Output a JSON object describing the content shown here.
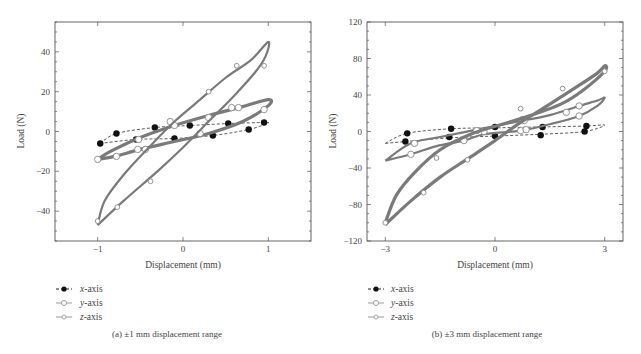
{
  "figure": {
    "panels": [
      {
        "id": "a",
        "caption": "(a)  ±1 mm displacement range",
        "xlabel": "Displacement (mm)",
        "ylabel": "Load (N)"
      },
      {
        "id": "b",
        "caption": "(b)  ±3 mm displacement range",
        "xlabel": "Displacement (mm)",
        "ylabel": "Load (N)"
      }
    ],
    "legend": [
      {
        "axis": "x",
        "suffix": "-axis",
        "marker": "filled-circle",
        "line": "dashed"
      },
      {
        "axis": "y",
        "suffix": "-axis",
        "marker": "open-circle",
        "line": "solid"
      },
      {
        "axis": "z",
        "suffix": "-axis",
        "marker": "open-diamond-circle",
        "line": "solid"
      }
    ],
    "colors": {
      "series_line": "#7a7a7a",
      "x_marker": "#111111",
      "frame": "#555555",
      "text": "#444444"
    }
  },
  "chart_data": [
    {
      "type": "line",
      "title": "(a) ±1 mm displacement range",
      "xlabel": "Displacement (mm)",
      "ylabel": "Load (N)",
      "xlim": [
        -1.5,
        1.5
      ],
      "ylim": [
        -55,
        55
      ],
      "xticks": [
        -1,
        0,
        1
      ],
      "yticks": [
        -40,
        -20,
        0,
        20,
        40
      ],
      "grid": false,
      "legend_position": "below",
      "series": [
        {
          "name": "x-axis",
          "style": "dashed",
          "loop": [
            [
              -0.97,
              -6
            ],
            [
              -0.78,
              -1
            ],
            [
              -0.33,
              2
            ],
            [
              0.08,
              3
            ],
            [
              0.53,
              4
            ],
            [
              0.95,
              4.5
            ],
            [
              0.98,
              4
            ],
            [
              0.77,
              1
            ],
            [
              0.35,
              -2
            ],
            [
              -0.1,
              -3.5
            ],
            [
              -0.55,
              -4
            ],
            [
              -0.97,
              -6
            ]
          ],
          "markers": [
            [
              -0.97,
              -6
            ],
            [
              -0.78,
              -1
            ],
            [
              -0.33,
              2
            ],
            [
              0.08,
              3
            ],
            [
              0.53,
              4
            ],
            [
              0.95,
              4.5
            ],
            [
              0.77,
              1
            ],
            [
              0.35,
              -2
            ],
            [
              -0.1,
              -3.5
            ],
            [
              -0.55,
              -4
            ]
          ]
        },
        {
          "name": "y-axis",
          "style": "solid-thick",
          "loop": [
            [
              -1,
              -14
            ],
            [
              -0.85,
              -10
            ],
            [
              -0.5,
              -3
            ],
            [
              -0.1,
              3
            ],
            [
              0.3,
              8
            ],
            [
              0.7,
              12.5
            ],
            [
              1,
              16
            ],
            [
              1,
              13
            ],
            [
              0.7,
              5
            ],
            [
              0.3,
              -1
            ],
            [
              -0.1,
              -5
            ],
            [
              -0.5,
              -9
            ],
            [
              -0.8,
              -12.5
            ],
            [
              -1,
              -14
            ]
          ],
          "markers": [
            [
              -1,
              -14
            ],
            [
              -0.78,
              -12.5
            ],
            [
              -0.52,
              -4
            ],
            [
              -0.44,
              -9
            ],
            [
              -0.1,
              3
            ],
            [
              0.3,
              7
            ],
            [
              0.57,
              12
            ],
            [
              0.65,
              12
            ],
            [
              0.95,
              11
            ],
            [
              0.2,
              -1
            ],
            [
              -0.53,
              -9
            ],
            [
              -0.15,
              5
            ]
          ]
        },
        {
          "name": "z-axis",
          "style": "solid",
          "loop": [
            [
              -1,
              -47
            ],
            [
              -0.7,
              -35
            ],
            [
              -0.3,
              -20
            ],
            [
              0,
              -8
            ],
            [
              0.3,
              5
            ],
            [
              0.6,
              18
            ],
            [
              0.85,
              30
            ],
            [
              0.97,
              38
            ],
            [
              1,
              45
            ],
            [
              0.8,
              36
            ],
            [
              0.5,
              27
            ],
            [
              0.2,
              16
            ],
            [
              -0.1,
              5
            ],
            [
              -0.4,
              -8
            ],
            [
              -0.7,
              -22
            ],
            [
              -0.92,
              -35
            ],
            [
              -1,
              -47
            ]
          ],
          "markers": [
            [
              -1,
              -45
            ],
            [
              -0.77,
              -38
            ],
            [
              -0.38,
              -25
            ],
            [
              0.3,
              20
            ],
            [
              0.63,
              33
            ],
            [
              0.95,
              33
            ]
          ]
        }
      ]
    },
    {
      "type": "line",
      "title": "(b) ±3 mm displacement range",
      "xlabel": "Displacement (mm)",
      "ylabel": "Load (N)",
      "xlim": [
        -3.5,
        3.5
      ],
      "ylim": [
        -120,
        120
      ],
      "xticks": [
        -3,
        0,
        3
      ],
      "yticks": [
        -120,
        -80,
        -40,
        0,
        40,
        80,
        120
      ],
      "grid": false,
      "legend_position": "below",
      "series": [
        {
          "name": "x-axis",
          "style": "dashed",
          "loop": [
            [
              -3,
              -13
            ],
            [
              -2.4,
              -2
            ],
            [
              -1.2,
              3
            ],
            [
              0,
              4
            ],
            [
              1.3,
              5
            ],
            [
              2.5,
              6
            ],
            [
              3,
              7
            ],
            [
              2.45,
              0
            ],
            [
              1.25,
              -3
            ],
            [
              0,
              -5
            ],
            [
              -1.25,
              -7
            ],
            [
              -2.45,
              -11
            ],
            [
              -3,
              -13
            ]
          ],
          "markers": [
            [
              -2.4,
              -2
            ],
            [
              -2.45,
              -11
            ],
            [
              -1.2,
              3
            ],
            [
              -1.25,
              -6
            ],
            [
              0,
              5
            ],
            [
              0,
              -5
            ],
            [
              1.3,
              5
            ],
            [
              1.25,
              -4
            ],
            [
              2.5,
              6
            ],
            [
              2.45,
              0
            ]
          ]
        },
        {
          "name": "y-axis",
          "style": "solid",
          "loop": [
            [
              -3,
              -32
            ],
            [
              -2.3,
              -13
            ],
            [
              -1.5,
              -6
            ],
            [
              -0.5,
              2
            ],
            [
              0.5,
              10
            ],
            [
              1.5,
              18
            ],
            [
              2.3,
              28
            ],
            [
              2.8,
              34
            ],
            [
              3,
              37
            ],
            [
              2.8,
              28
            ],
            [
              2.3,
              17
            ],
            [
              1.5,
              8
            ],
            [
              0.7,
              1
            ],
            [
              -0.3,
              -3
            ],
            [
              -0.85,
              -10
            ],
            [
              -1.6,
              -16
            ],
            [
              -2.3,
              -25
            ],
            [
              -3,
              -32
            ]
          ],
          "markers": [
            [
              -2.3,
              -25
            ],
            [
              -2.2,
              -13
            ],
            [
              -0.85,
              -10
            ],
            [
              -0.5,
              1
            ],
            [
              -0.3,
              0
            ],
            [
              0.75,
              13
            ],
            [
              0.8,
              12
            ],
            [
              0.7,
              1
            ],
            [
              0.85,
              2
            ],
            [
              1.95,
              21
            ],
            [
              2.3,
              28
            ],
            [
              2.3,
              17
            ]
          ]
        },
        {
          "name": "z-axis",
          "style": "solid-thick",
          "loop": [
            [
              -3,
              -102
            ],
            [
              -2.3,
              -76
            ],
            [
              -1.5,
              -50
            ],
            [
              -0.75,
              -30
            ],
            [
              0,
              -10
            ],
            [
              0.7,
              10
            ],
            [
              1.5,
              30
            ],
            [
              2.2,
              48
            ],
            [
              2.8,
              64
            ],
            [
              3,
              72
            ],
            [
              3,
              66
            ],
            [
              2.4,
              45
            ],
            [
              1.8,
              30
            ],
            [
              1,
              18
            ],
            [
              0.2,
              8
            ],
            [
              -0.6,
              -2
            ],
            [
              -1.5,
              -20
            ],
            [
              -2.2,
              -45
            ],
            [
              -2.7,
              -70
            ],
            [
              -3,
              -100
            ]
          ],
          "markers": [
            [
              -3,
              -100
            ],
            [
              -1.95,
              -67
            ],
            [
              -1.6,
              -29
            ],
            [
              -0.75,
              -31
            ],
            [
              0.7,
              25
            ],
            [
              1.85,
              47
            ],
            [
              3,
              66
            ]
          ]
        }
      ]
    }
  ]
}
